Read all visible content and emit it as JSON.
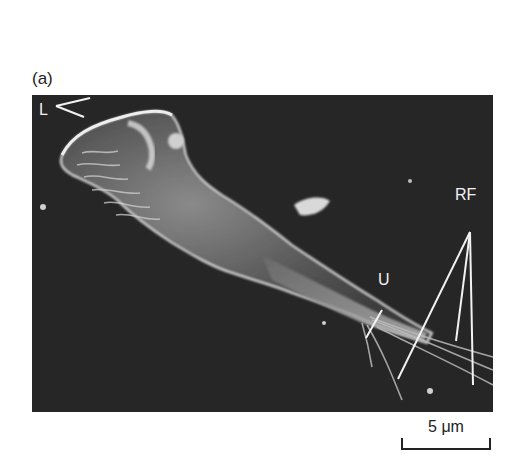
{
  "figure": {
    "panel_label": "(a)",
    "image_description": "Scanning electron micrograph of a migrating cell on a dark background",
    "annotations": {
      "lamellipodia": "L",
      "uropod": "U",
      "retraction_fibers": "RF"
    },
    "scale_bar": {
      "label": "5 μm"
    },
    "colors": {
      "background": "#262626",
      "cell_highlight": "#e0e0e0",
      "annotation_text": "#f2f2f2",
      "page_text": "#222222"
    }
  }
}
